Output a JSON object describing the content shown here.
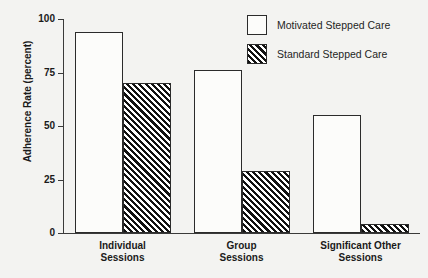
{
  "chart_data": {
    "type": "bar",
    "title": "",
    "xlabel": "",
    "ylabel": "Adherence Rate (percent)",
    "ylim": [
      0,
      100
    ],
    "yticks": [
      "0",
      "25",
      "50",
      "75",
      "100"
    ],
    "grid": false,
    "legend_position": "top-right",
    "categories": [
      "Individual\nSessions",
      "Group\nSessions",
      "Significant Other\nSessions"
    ],
    "series": [
      {
        "name": "Motivated Stepped Care",
        "style": "open",
        "values": [
          94,
          76,
          55
        ]
      },
      {
        "name": "Standard Stepped Care",
        "style": "hatched",
        "values": [
          70,
          29,
          4
        ]
      }
    ]
  },
  "colors": {
    "background": "#f3f3f1",
    "axis": "#3a3a3a",
    "bar_outline": "#2b2b2b",
    "open_fill": "#fcfcfa",
    "hatch_ink": "#111111",
    "text": "#1a1a1a"
  }
}
